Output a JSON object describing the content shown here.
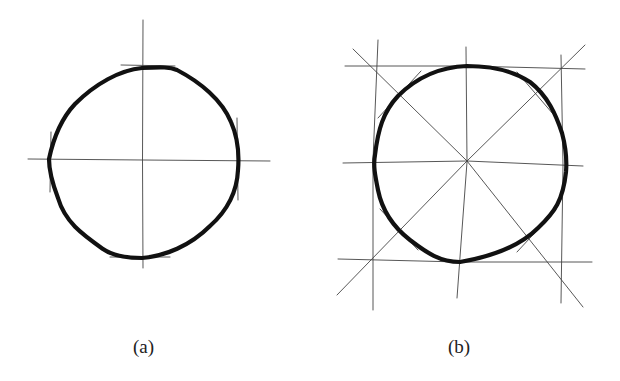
{
  "figure": {
    "panels": [
      {
        "id": "a",
        "caption": "(a)",
        "description": "Freehand circle constructed from two perpendicular axes with 4 tangent marks"
      },
      {
        "id": "b",
        "caption": "(b)",
        "description": "Freehand circle inscribed in a square with axes and diagonals giving 8 guide points"
      }
    ],
    "colors": {
      "stroke": "#111111",
      "guide": "#444444",
      "background": "#ffffff"
    }
  }
}
